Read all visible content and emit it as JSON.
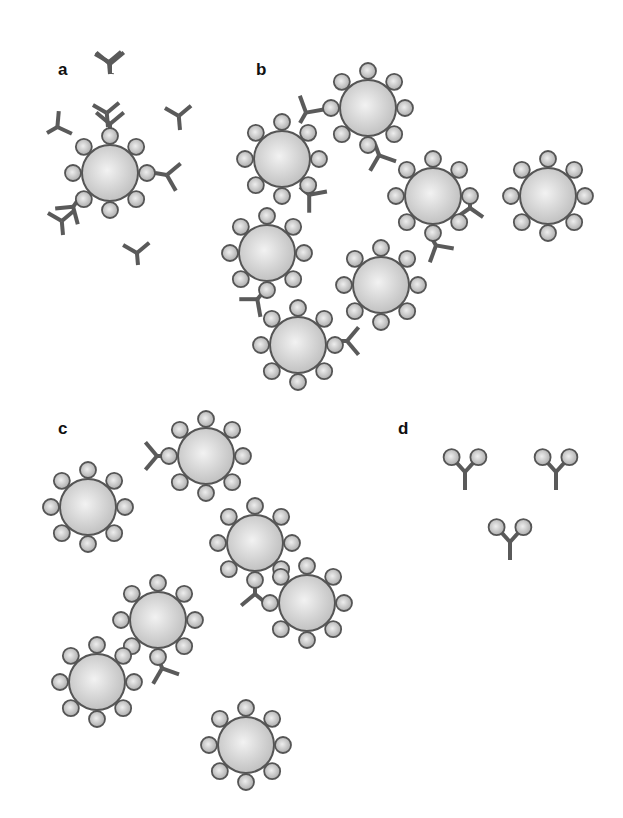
{
  "figure": {
    "panels": [
      {
        "id": "a",
        "label": "a",
        "x": 58,
        "y": 60
      },
      {
        "id": "b",
        "label": "b",
        "x": 256,
        "y": 60
      },
      {
        "id": "c",
        "label": "c",
        "x": 58,
        "y": 439
      },
      {
        "id": "d",
        "label": "d",
        "x": 398,
        "y": 439
      }
    ],
    "colors": {
      "antibody": "#5a5a5a",
      "sphere_fill_center": "#f2f2f2",
      "sphere_fill_edge": "#bdbdbd",
      "sphere_stroke": "#555555",
      "background": "#ffffff"
    },
    "legend": {
      "large_sphere": "particle",
      "small_bead": "antigen",
      "y_shape": "antibody"
    },
    "spheres": [
      {
        "panel": "a",
        "cx": 110,
        "cy": 173,
        "beads": [
          90,
          45,
          0,
          315,
          270,
          225,
          180,
          135
        ]
      },
      {
        "panel": "b",
        "cx": 368,
        "cy": 108
      },
      {
        "panel": "b",
        "cx": 282,
        "cy": 159
      },
      {
        "panel": "b",
        "cx": 433,
        "cy": 196
      },
      {
        "panel": "b",
        "cx": 548,
        "cy": 196
      },
      {
        "panel": "b",
        "cx": 267,
        "cy": 253
      },
      {
        "panel": "b",
        "cx": 381,
        "cy": 285
      },
      {
        "panel": "b",
        "cx": 298,
        "cy": 345
      },
      {
        "panel": "c",
        "cx": 206,
        "cy": 456
      },
      {
        "panel": "c",
        "cx": 88,
        "cy": 507
      },
      {
        "panel": "c",
        "cx": 255,
        "cy": 543
      },
      {
        "panel": "c",
        "cx": 158,
        "cy": 620
      },
      {
        "panel": "c",
        "cx": 307,
        "cy": 603
      },
      {
        "panel": "c",
        "cx": 97,
        "cy": 682
      },
      {
        "panel": "c",
        "cx": 246,
        "cy": 745
      }
    ]
  }
}
